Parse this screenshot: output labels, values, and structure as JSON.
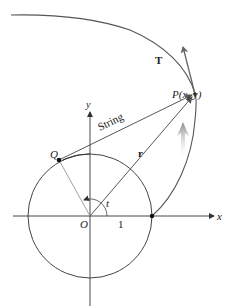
{
  "figure": {
    "type": "involute-of-circle",
    "labels": {
      "tangent": "T",
      "point_p": "P(x, y)",
      "string": "String",
      "point_q": "Q",
      "radius_vector": "r",
      "y_axis": "y",
      "x_axis": "x",
      "origin": "O",
      "unit": "1",
      "angle": "t"
    },
    "colors": {
      "curve": "#555555",
      "axes": "#333333",
      "motion_arrow": "#999999",
      "background": "#ffffff"
    }
  }
}
